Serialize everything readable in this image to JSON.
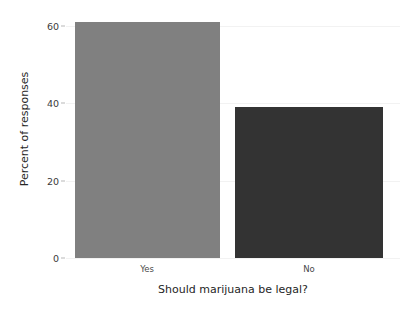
{
  "chart_data": {
    "type": "bar",
    "title": "",
    "categories": [
      "Yes",
      "No"
    ],
    "values": [
      61,
      39
    ],
    "xlabel": "Should marijuana be legal?",
    "ylabel": "Percent of responses",
    "ylim": [
      0,
      62
    ],
    "yticks": [
      0,
      20,
      40,
      60
    ],
    "ytick_labels": [
      "0",
      "20",
      "40",
      "60"
    ],
    "grid": true,
    "legend": "none",
    "bar_colors": [
      "#808080",
      "#333333"
    ],
    "background": "#ffffff"
  },
  "axis": {
    "ylabel": "Percent of responses",
    "xlabel": "Should marijuana be legal?",
    "ytick_0": "0",
    "ytick_1": "20",
    "ytick_2": "40",
    "ytick_3": "60",
    "xtick_0": "Yes",
    "xtick_1": "No"
  }
}
